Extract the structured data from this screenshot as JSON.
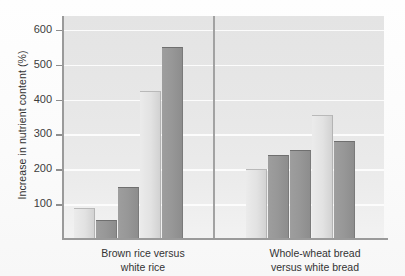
{
  "chart_data": {
    "type": "bar",
    "title": "",
    "subtitle": "",
    "xlabel": "",
    "ylabel": "Increase in nutrient content (%)",
    "ylim": [
      0,
      640
    ],
    "ytick_labels": [
      "100",
      "200",
      "300",
      "400",
      "500",
      "600"
    ],
    "yticks": [
      100,
      200,
      300,
      400,
      500,
      600
    ],
    "grid": true,
    "legend": "none",
    "categories": [
      "Brown rice versus white rice",
      "Whole-wheat bread versus white bread"
    ],
    "groups": [
      {
        "label_line1": "Brown rice versus",
        "label_line2": "white rice",
        "bars": [
          {
            "value": 90,
            "shade": "light"
          },
          {
            "value": 55,
            "shade": "dark"
          },
          {
            "value": 150,
            "shade": "dark"
          },
          {
            "value": 425,
            "shade": "light"
          },
          {
            "value": 550,
            "shade": "dark"
          }
        ]
      },
      {
        "label_line1": "Whole-wheat bread",
        "label_line2": "versus white bread",
        "bars": [
          {
            "value": 200,
            "shade": "light"
          },
          {
            "value": 240,
            "shade": "dark"
          },
          {
            "value": 255,
            "shade": "dark"
          },
          {
            "value": 355,
            "shade": "light"
          },
          {
            "value": 280,
            "shade": "dark"
          }
        ]
      }
    ]
  },
  "axis": {
    "y_title": "Increase in nutrient content (%)",
    "tick_600": "600",
    "tick_500": "500",
    "tick_400": "400",
    "tick_300": "300",
    "tick_200": "200",
    "tick_100": "100"
  },
  "xlabels": {
    "group1_line1": "Brown rice versus",
    "group1_line2": "white rice",
    "group2_line1": "Whole-wheat bread",
    "group2_line2": "versus white bread"
  },
  "colors": {
    "plot_background": "#e6e6e6",
    "gridline": "#fcfcfc",
    "bar_light": "#e2e2e2",
    "bar_dark": "#979797",
    "axis": "#9a9a9a",
    "text": "#333333"
  }
}
